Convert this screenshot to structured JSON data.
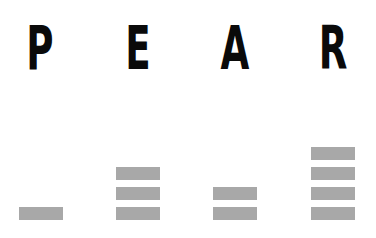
{
  "chart_data": {
    "type": "bar",
    "title": "",
    "categories": [
      "P",
      "E",
      "A",
      "R"
    ],
    "values": [
      1,
      3,
      2,
      4
    ],
    "xlabel": "",
    "ylabel": "",
    "ylim": [
      0,
      4
    ],
    "grid": false,
    "legend": null,
    "style": "stacked unit blocks",
    "bar_color": "#a8a8a8",
    "label_color": "#0a0a0a"
  }
}
